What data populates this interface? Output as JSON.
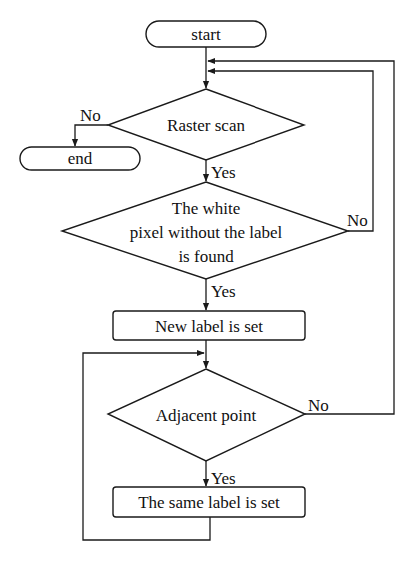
{
  "diagram": {
    "type": "flowchart",
    "nodes": [
      {
        "id": "start",
        "shape": "terminal",
        "label": "start"
      },
      {
        "id": "end",
        "shape": "terminal",
        "label": "end"
      },
      {
        "id": "raster",
        "shape": "decision",
        "label": "Raster scan"
      },
      {
        "id": "white",
        "shape": "decision",
        "label_lines": [
          "The white",
          "pixel without the label",
          "is found"
        ]
      },
      {
        "id": "newlabel",
        "shape": "process",
        "label": "New label is set"
      },
      {
        "id": "adjacent",
        "shape": "decision",
        "label": "Adjacent point"
      },
      {
        "id": "samelabel",
        "shape": "process",
        "label": "The same label is set"
      }
    ],
    "edges": [
      {
        "from": "start",
        "to": "raster",
        "label": ""
      },
      {
        "from": "raster",
        "to": "end",
        "label": "No"
      },
      {
        "from": "raster",
        "to": "white",
        "label": "Yes"
      },
      {
        "from": "white",
        "to": "raster",
        "label": "No"
      },
      {
        "from": "white",
        "to": "newlabel",
        "label": "Yes"
      },
      {
        "from": "newlabel",
        "to": "adjacent",
        "label": ""
      },
      {
        "from": "adjacent",
        "to": "raster",
        "label": "No"
      },
      {
        "from": "adjacent",
        "to": "samelabel",
        "label": "Yes"
      },
      {
        "from": "samelabel",
        "to": "adjacent",
        "label": ""
      }
    ]
  },
  "labels": {
    "start": "start",
    "end": "end",
    "raster": "Raster scan",
    "white_1": "The white",
    "white_2": "pixel without the label",
    "white_3": "is found",
    "newlabel": "New label is set",
    "adjacent": "Adjacent point",
    "samelabel": "The same label is set",
    "no": "No",
    "yes": "Yes"
  }
}
